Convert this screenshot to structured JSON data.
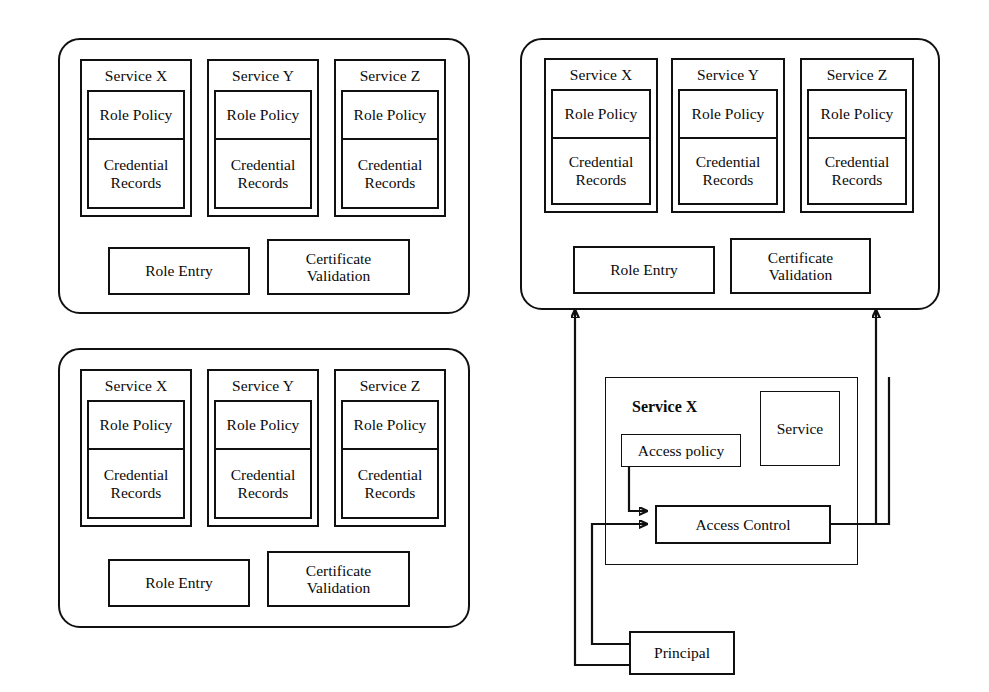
{
  "diagram": {
    "stroke_color": "#101010",
    "background": "#ffffff"
  },
  "labels": {
    "service_x": "Service X",
    "service_y": "Service Y",
    "service_z": "Service Z",
    "role_policy": "Role Policy",
    "credential_records": "Credential\nRecords",
    "credential_line1": "Credential",
    "credential_line2": "Records",
    "role_entry": "Role Entry",
    "certificate_validation_line1": "Certificate",
    "certificate_validation_line2": "Validation",
    "access_policy": "Access policy",
    "access_control": "Access Control",
    "service": "Service",
    "principal": "Principal"
  },
  "panels": [
    {
      "id": "top-left",
      "services": [
        {
          "name": "Service X",
          "cells": [
            "Role Policy",
            "Credential Records"
          ]
        },
        {
          "name": "Service Y",
          "cells": [
            "Role Policy",
            "Credential Records"
          ]
        },
        {
          "name": "Service Z",
          "cells": [
            "Role Policy",
            "Credential Records"
          ]
        }
      ],
      "footer_boxes": [
        "Role Entry",
        "Certificate Validation"
      ]
    },
    {
      "id": "bottom-left",
      "services": [
        {
          "name": "Service X",
          "cells": [
            "Role Policy",
            "Credential Records"
          ]
        },
        {
          "name": "Service Y",
          "cells": [
            "Role Policy",
            "Credential Records"
          ]
        },
        {
          "name": "Service Z",
          "cells": [
            "Role Policy",
            "Credential Records"
          ]
        }
      ],
      "footer_boxes": [
        "Role Entry",
        "Certificate Validation"
      ]
    },
    {
      "id": "top-right",
      "services": [
        {
          "name": "Service X",
          "cells": [
            "Role Policy",
            "Credential Records"
          ]
        },
        {
          "name": "Service Y",
          "cells": [
            "Role Policy",
            "Credential Records"
          ]
        },
        {
          "name": "Service Z",
          "cells": [
            "Role Policy",
            "Credential Records"
          ]
        }
      ],
      "footer_boxes": [
        "Role Entry",
        "Certificate Validation"
      ]
    }
  ],
  "detail": {
    "container_label": "Service X",
    "nodes": [
      "Access policy",
      "Service",
      "Access Control",
      "Principal"
    ]
  },
  "connections": [
    {
      "from": "Access policy",
      "to": "Access Control",
      "arrow": true
    },
    {
      "from": "Principal",
      "to": "Access Control",
      "arrow": true
    },
    {
      "from": "Principal",
      "to": "Role Entry",
      "arrow": true
    },
    {
      "from": "Access Control",
      "to": "Certificate Validation",
      "arrow": true
    }
  ]
}
